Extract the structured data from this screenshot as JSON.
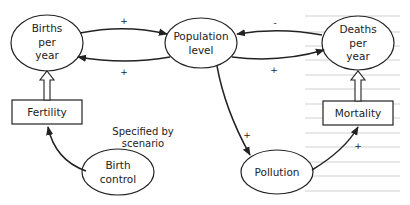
{
  "diagram": {
    "type": "causal-loop",
    "nodes": {
      "births": {
        "line1": "Births",
        "line2": "per",
        "line3": "year",
        "shape": "ellipse"
      },
      "population": {
        "line1": "Population",
        "line2": "level",
        "shape": "ellipse"
      },
      "deaths": {
        "line1": "Deaths",
        "line2": "per",
        "line3": "year",
        "shape": "ellipse"
      },
      "fertility": {
        "label": "Fertility",
        "shape": "rectangle"
      },
      "mortality": {
        "label": "Mortality",
        "shape": "rectangle"
      },
      "birth_control": {
        "line1": "Birth",
        "line2": "control",
        "shape": "ellipse"
      },
      "pollution": {
        "label": "Pollution",
        "shape": "ellipse"
      }
    },
    "annotation": {
      "line1": "Specified by",
      "line2": "scenario"
    },
    "links": [
      {
        "from": "Births per year",
        "to": "Population level",
        "sign": "+"
      },
      {
        "from": "Population level",
        "to": "Births per year",
        "sign": "+"
      },
      {
        "from": "Deaths per year",
        "to": "Population level",
        "sign": "-"
      },
      {
        "from": "Population level",
        "to": "Deaths per year",
        "sign": "+"
      },
      {
        "from": "Population level",
        "to": "Pollution",
        "sign": "+"
      },
      {
        "from": "Pollution",
        "to": "Mortality",
        "sign": "+"
      },
      {
        "from": "Birth control",
        "to": "Fertility",
        "sign": ""
      },
      {
        "from": "Fertility",
        "to": "Births per year",
        "sign": "",
        "style": "hollow-arrow"
      },
      {
        "from": "Mortality",
        "to": "Deaths per year",
        "sign": "",
        "style": "hollow-arrow"
      }
    ],
    "signs": {
      "births_to_pop": "+",
      "pop_to_births": "+",
      "deaths_to_pop": "-",
      "pop_to_deaths": "+",
      "pop_to_pollution": "+",
      "pollution_to_mortality": "+"
    }
  }
}
